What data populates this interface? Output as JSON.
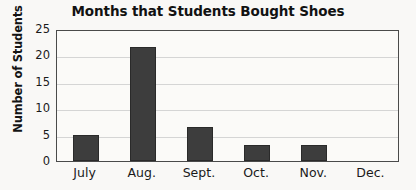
{
  "chart_data": {
    "type": "bar",
    "title": "Months that Students Bought Shoes",
    "xlabel": "",
    "ylabel": "Number of Students",
    "categories": [
      "July",
      "Aug.",
      "Sept.",
      "Oct.",
      "Nov.",
      "Dec."
    ],
    "values": [
      5,
      21.5,
      6.5,
      3,
      3,
      0
    ],
    "ylim": [
      0,
      25
    ],
    "yticks": [
      0,
      5,
      10,
      15,
      20,
      25
    ],
    "ytick_labels": [
      "0",
      "5",
      "10",
      "15",
      "20",
      "25"
    ],
    "grid": "horizontal",
    "legend": "none",
    "bar_color": "#3d3d3d",
    "gridline_color": "#d5d5d5",
    "axis_color": "#4a4a4a",
    "background_color": "#f9f8f6",
    "text_color": "#141414",
    "series": [
      {
        "name": "Number of Students",
        "values": [
          5,
          21.5,
          6.5,
          3,
          3,
          0
        ]
      }
    ]
  }
}
